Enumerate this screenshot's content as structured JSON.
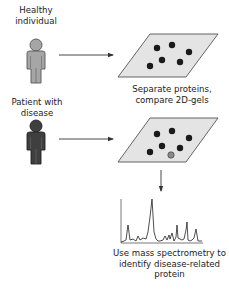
{
  "labels": {
    "healthy": [
      "Healthy",
      "individual"
    ],
    "patient": [
      "Patient with",
      "disease"
    ],
    "gel_caption": [
      "Separate proteins,",
      "compare 2D-gels"
    ],
    "ms_caption": [
      "Use mass spectrometry to",
      "identify disease-related",
      "protein"
    ]
  },
  "colors": {
    "healthy_figure": "#a6a6a6",
    "patient_figure": "#3f3f3f",
    "gel_fill": "#e4e4e4",
    "spot": "#1a1a1a",
    "highlight_spot": "#8a8a8a",
    "arrow": "#333333"
  },
  "gel_healthy_spots": [
    [
      126,
      44
    ],
    [
      170,
      40
    ],
    [
      195,
      48
    ],
    [
      140,
      58
    ],
    [
      110,
      65
    ],
    [
      195,
      62
    ]
  ],
  "gel_patient_spots": [
    [
      126,
      136
    ],
    [
      170,
      132
    ],
    [
      195,
      140
    ],
    [
      140,
      150
    ],
    [
      110,
      157
    ],
    [
      195,
      154
    ]
  ],
  "gel_patient_extra_spot": [
    171,
    163
  ]
}
